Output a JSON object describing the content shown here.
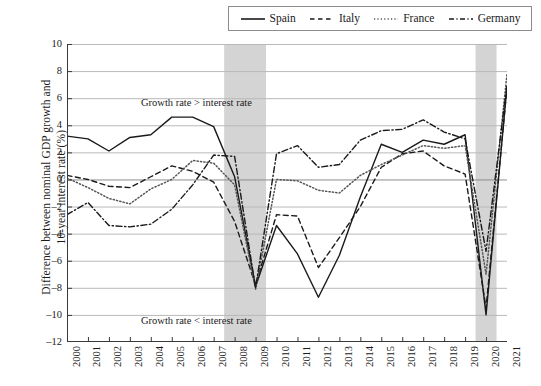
{
  "chart_data": {
    "type": "line",
    "title": "",
    "xlabel": "",
    "ylabel": "Difference between nominal GDP growth and 10-year interest rate (%)",
    "ylabel_line1": "Difference between nominal GDP growth and",
    "ylabel_line2": "10-year interest rate (%)",
    "xlim": [
      2000,
      2021
    ],
    "ylim": [
      -12,
      10
    ],
    "yticks": [
      10,
      8,
      6,
      4,
      2,
      0,
      -2,
      -4,
      -6,
      -8,
      -10,
      -12
    ],
    "grid": "horizontal",
    "legend_position": "top-right",
    "x": [
      2000,
      2001,
      2002,
      2003,
      2004,
      2005,
      2006,
      2007,
      2008,
      2009,
      2010,
      2011,
      2012,
      2013,
      2014,
      2015,
      2016,
      2017,
      2018,
      2019,
      2020,
      2021
    ],
    "categories": [
      "2000",
      "2001",
      "2002",
      "2003",
      "2004",
      "2005",
      "2006",
      "2007",
      "2008",
      "2009",
      "2010",
      "2011",
      "2012",
      "2013",
      "2014",
      "2015",
      "2016",
      "2017",
      "2018",
      "2019",
      "2020",
      "2021"
    ],
    "series": [
      {
        "name": "Spain",
        "style": "solid",
        "color": "#1a1a1a",
        "values": [
          3.2,
          3.0,
          2.1,
          3.1,
          3.3,
          4.6,
          4.6,
          3.9,
          0.2,
          -7.9,
          -3.4,
          -5.5,
          -8.7,
          -5.6,
          -1.3,
          2.6,
          2.0,
          2.9,
          2.6,
          3.3,
          -10.0,
          6.9
        ]
      },
      {
        "name": "Italy",
        "style": "dashed",
        "color": "#1a1a1a",
        "values": [
          0.3,
          0.0,
          -0.5,
          -0.6,
          0.2,
          1.0,
          0.6,
          -0.2,
          -3.1,
          -7.8,
          -2.6,
          -2.7,
          -6.5,
          -4.3,
          -2.0,
          0.9,
          1.9,
          2.1,
          1.0,
          0.4,
          -9.5,
          6.8
        ]
      },
      {
        "name": "France",
        "style": "dotted",
        "color": "#555555",
        "values": [
          0.1,
          -0.6,
          -1.4,
          -1.8,
          -0.7,
          0.0,
          1.4,
          1.2,
          -0.4,
          -8.1,
          0.0,
          -0.1,
          -0.8,
          -1.0,
          0.3,
          1.1,
          1.8,
          2.5,
          2.3,
          2.5,
          -7.0,
          7.8
        ]
      },
      {
        "name": "Germany",
        "style": "dashdot",
        "color": "#1a1a1a",
        "values": [
          -2.6,
          -1.7,
          -3.4,
          -3.5,
          -3.3,
          -2.2,
          -0.4,
          1.8,
          1.7,
          -8.0,
          1.9,
          2.5,
          0.9,
          1.1,
          2.9,
          3.6,
          3.7,
          4.4,
          3.5,
          3.0,
          -5.3,
          7.0
        ]
      }
    ],
    "shaded_bands": [
      {
        "label": "2008-2009 crisis",
        "from": 2007.5,
        "to": 2009.5,
        "color": "#d4d4d4"
      },
      {
        "label": "2020 crisis",
        "from": 2019.5,
        "to": 2020.5,
        "color": "#d4d4d4"
      }
    ],
    "annotations": [
      {
        "name": "growth-above-interest",
        "text": "Growth rate > interest rate"
      },
      {
        "name": "growth-below-interest",
        "text": "Growth rate < interest rate"
      }
    ]
  }
}
